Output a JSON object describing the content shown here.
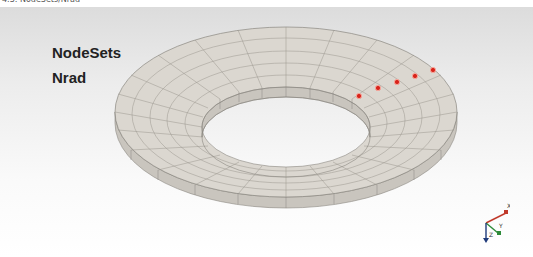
{
  "window": {
    "title": "4.3: NodeSets/Nrad",
    "title_icon": "window-icon"
  },
  "viewport": {
    "background_top": "#dcdcdc",
    "background_bottom": "#ffffff",
    "labels": [
      "NodeSets",
      "Nrad"
    ],
    "model": {
      "type": "annular-ring-mesh",
      "surface_color": "#d9d5ce",
      "edge_color": "#8a8780",
      "node_color": "#d8231a",
      "highlighted_nodes": [
        {
          "x": 359,
          "y": 96
        },
        {
          "x": 378,
          "y": 88
        },
        {
          "x": 397,
          "y": 82
        },
        {
          "x": 415,
          "y": 76
        },
        {
          "x": 433,
          "y": 70
        }
      ]
    },
    "axis_triad": {
      "x_label": "X",
      "y_label": "Y",
      "z_label": "Z",
      "x_color": "#c0392b",
      "y_color": "#2e8b3a",
      "z_color": "#1f3a7a"
    }
  }
}
